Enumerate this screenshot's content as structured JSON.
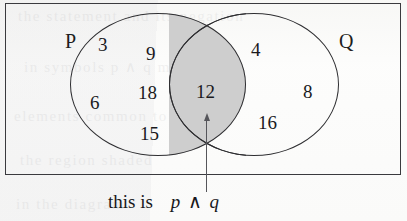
{
  "diagram": {
    "type": "venn-2-set",
    "frame_label": "",
    "sets": [
      {
        "name": "P",
        "label": "P"
      },
      {
        "name": "Q",
        "label": "Q"
      }
    ],
    "regions": {
      "p_only": [
        "3",
        "9",
        "6",
        "18",
        "15"
      ],
      "intersection": [
        "12"
      ],
      "q_only": [
        "4",
        "8",
        "16"
      ]
    },
    "numbers": {
      "n3": "3",
      "n9": "9",
      "n6": "6",
      "n18": "18",
      "n15": "15",
      "n12": "12",
      "n4": "4",
      "n8": "8",
      "n16": "16"
    },
    "shaded_region": "intersection",
    "shade_color": "#cecece",
    "stroke_color": "#2e2e31",
    "frame_color": "#3a3a3e"
  },
  "annotation": {
    "arrow": {
      "icon": "arrow-up-icon",
      "points_to": "intersection",
      "color": "#55555a"
    },
    "caption": {
      "text": "this is",
      "formula_left": "p",
      "operator": "∧",
      "formula_right": "q"
    }
  },
  "background_ghost": {
    "lines": [
      "the statement and its negation",
      "in symbols p ∧ q means both",
      "elements common to",
      "the region shaded",
      "in the diagram"
    ]
  }
}
